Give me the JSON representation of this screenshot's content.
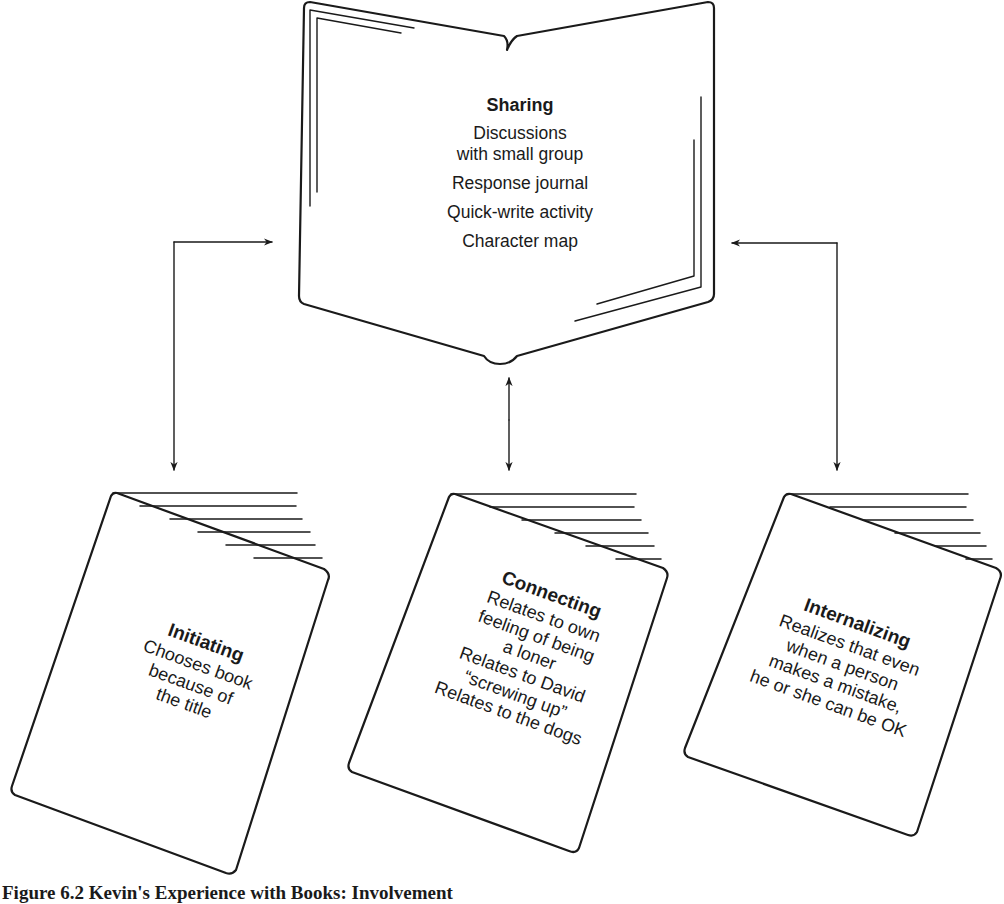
{
  "figure": {
    "caption": "Figure 6.2  Kevin's Experience with Books: Involvement",
    "line_color": "#1a1a1a",
    "background": "#ffffff"
  },
  "sharing": {
    "title": "Sharing",
    "lines": [
      "Discussions",
      "with small group",
      "Response journal",
      "Quick-write activity",
      "Character map"
    ],
    "icon": "open-book-icon"
  },
  "books": [
    {
      "title": "Initiating",
      "lines": [
        "Chooses book",
        "because of",
        "the title"
      ],
      "icon": "closed-book-icon"
    },
    {
      "title": "Connecting",
      "lines": [
        "Relates to own",
        "feeling of being",
        "a loner",
        "Relates to David",
        "“screwing up”",
        "Relates to the dogs"
      ],
      "icon": "closed-book-icon"
    },
    {
      "title": "Internalizing",
      "lines": [
        "Realizes that even",
        "when a person",
        "makes a mistake,",
        "he or she can be OK"
      ],
      "icon": "closed-book-icon"
    }
  ],
  "connectors": [
    {
      "from": "sharing",
      "to": "initiating",
      "type": "bidirectional-arrow"
    },
    {
      "from": "sharing",
      "to": "connecting",
      "type": "bidirectional-arrow"
    },
    {
      "from": "sharing",
      "to": "internalizing",
      "type": "bidirectional-arrow"
    }
  ]
}
